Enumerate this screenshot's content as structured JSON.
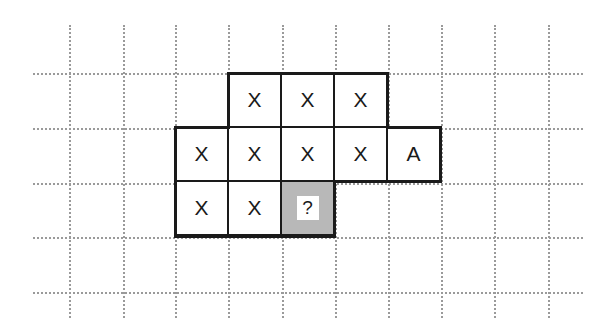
{
  "grid": {
    "vertical_lines_x": [
      69,
      123,
      175,
      228,
      282,
      335,
      388,
      441,
      494,
      548
    ],
    "horizontal_lines_y": [
      73,
      128,
      183,
      237,
      292
    ]
  },
  "cells": [
    {
      "row": 0,
      "col": 1,
      "label": "X"
    },
    {
      "row": 0,
      "col": 2,
      "label": "X"
    },
    {
      "row": 0,
      "col": 3,
      "label": "X"
    },
    {
      "row": 1,
      "col": 0,
      "label": "X"
    },
    {
      "row": 1,
      "col": 1,
      "label": "X"
    },
    {
      "row": 1,
      "col": 2,
      "label": "X"
    },
    {
      "row": 1,
      "col": 3,
      "label": "X"
    },
    {
      "row": 1,
      "col": 4,
      "label": "A"
    },
    {
      "row": 2,
      "col": 0,
      "label": "X"
    },
    {
      "row": 2,
      "col": 1,
      "label": "X"
    },
    {
      "row": 2,
      "col": 2,
      "label": "?",
      "shaded": true
    }
  ],
  "colors": {
    "outline": "#1a1a1a",
    "grid_dots": "#9a9a9a",
    "shade": "#b8b8b8"
  }
}
